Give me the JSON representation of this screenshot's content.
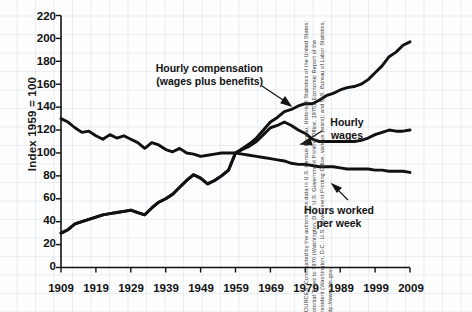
{
  "chart_data": {
    "type": "line",
    "title": "",
    "xlabel": "",
    "ylabel": "Index 1959 = 100",
    "xlim": [
      1909,
      2009
    ],
    "ylim": [
      0,
      220
    ],
    "grid": true,
    "legend": "inline-annotations",
    "yticks": [
      0,
      20,
      40,
      60,
      80,
      100,
      120,
      140,
      160,
      180,
      200,
      220
    ],
    "xticks": [
      1909,
      1919,
      1929,
      1939,
      1949,
      1959,
      1969,
      1979,
      1989,
      1999,
      2009
    ],
    "x": [
      1909,
      1911,
      1913,
      1915,
      1917,
      1919,
      1921,
      1923,
      1925,
      1927,
      1929,
      1931,
      1933,
      1935,
      1937,
      1939,
      1941,
      1943,
      1945,
      1947,
      1949,
      1951,
      1953,
      1955,
      1957,
      1959,
      1961,
      1963,
      1965,
      1967,
      1969,
      1971,
      1973,
      1975,
      1977,
      1979,
      1981,
      1983,
      1985,
      1987,
      1989,
      1991,
      1993,
      1995,
      1997,
      1999,
      2001,
      2003,
      2005,
      2007,
      2009
    ],
    "series": [
      {
        "name": "Hourly compensation (wages plus benefits)",
        "values": [
          30,
          33,
          38,
          40,
          42,
          44,
          46,
          47,
          48,
          49,
          50,
          48,
          46,
          52,
          57,
          60,
          64,
          70,
          76,
          81,
          78,
          73,
          76,
          80,
          85,
          100,
          104,
          108,
          113,
          120,
          127,
          131,
          136,
          138,
          141,
          143,
          143,
          146,
          150,
          152,
          155,
          157,
          158,
          160,
          164,
          170,
          176,
          184,
          188,
          194,
          197
        ]
      },
      {
        "name": "Hourly wages",
        "values": [
          30,
          33,
          38,
          40,
          42,
          44,
          46,
          47,
          48,
          49,
          50,
          48,
          46,
          52,
          57,
          60,
          64,
          70,
          76,
          81,
          78,
          73,
          76,
          80,
          85,
          100,
          103,
          106,
          110,
          116,
          122,
          124,
          127,
          124,
          120,
          117,
          112,
          110,
          110,
          110,
          110,
          110,
          110,
          111,
          113,
          116,
          118,
          120,
          119,
          119,
          120
        ]
      },
      {
        "name": "Hours worked per week",
        "values": [
          130,
          127,
          122,
          118,
          119,
          115,
          112,
          116,
          113,
          115,
          112,
          109,
          104,
          109,
          107,
          103,
          101,
          104,
          100,
          99,
          97,
          98,
          99,
          100,
          100,
          100,
          99,
          98,
          97,
          96,
          95,
          94,
          93,
          91,
          90,
          90,
          89,
          88,
          88,
          88,
          87,
          86,
          86,
          86,
          86,
          85,
          85,
          84,
          84,
          84,
          83
        ]
      }
    ],
    "annotations": [
      {
        "name": "hourly-compensation-label",
        "lines": [
          "Hourly compensation",
          "(wages plus benefits)"
        ]
      },
      {
        "name": "hourly-wages-label",
        "lines": [
          "Hourly",
          "wages"
        ]
      },
      {
        "name": "hours-worked-label",
        "lines": [
          "Hours worked",
          "per week"
        ]
      }
    ]
  },
  "axis": {
    "y_label": "Index 1959 = 100",
    "y_ticks": [
      "220",
      "200",
      "180",
      "160",
      "140",
      "120",
      "100",
      "80",
      "60",
      "40",
      "20",
      "0"
    ],
    "x_ticks": [
      "1909",
      "1919",
      "1929",
      "1939",
      "1949",
      "1959",
      "1969",
      "1979",
      "1989",
      "1999",
      "2009"
    ]
  },
  "annotations": {
    "compensation_line1": "Hourly compensation",
    "compensation_line2": "(wages plus benefits)",
    "wages_line1": "Hourly",
    "wages_line2": "wages",
    "hours_line1": "Hours worked",
    "hours_line2": "per week"
  },
  "source": {
    "text": "SOURCES: Constructed by the authors from data in U.S. Census Bureau, Historical Statistics of the United States: Colonial Times to 1970 (Washington, D.C.: U.S. Government Printing Office, 1975); Economic Report of the President (Washington, D.C.: U.S. Government Printing Office, various years); and U.S. Bureau of Labor Statistics, http://www.bls.gov."
  },
  "colors": {
    "line": "#111111",
    "axis": "#111111",
    "text": "#121212",
    "grid": "#c3d4e6"
  }
}
